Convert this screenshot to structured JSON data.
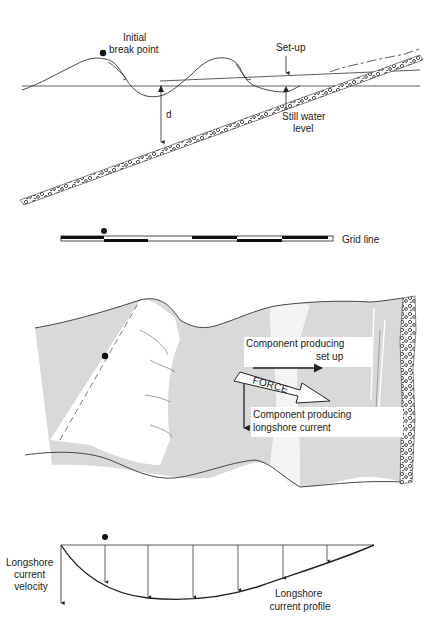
{
  "panel_profile": {
    "initial_break_point": [
      "Initial",
      "break point"
    ],
    "set_up": "Set-up",
    "depth": "d",
    "still_water_level": [
      "Still water",
      "level"
    ]
  },
  "panel_grid": {
    "grid_line": "Grid line"
  },
  "panel_plan": {
    "component_setup": [
      "Component producing",
      "set up"
    ],
    "force": "FORCE",
    "component_longshore": [
      "Component producing",
      "longshore current"
    ]
  },
  "panel_velocity": {
    "velocity_axis": [
      "Longshore",
      "current",
      "velocity"
    ],
    "profile": [
      "Longshore",
      "current profile"
    ]
  },
  "colors": {
    "ink": "#222222",
    "water_gray": "#d9d9d9",
    "breaker_white": "#ffffff",
    "background": "#ffffff"
  }
}
